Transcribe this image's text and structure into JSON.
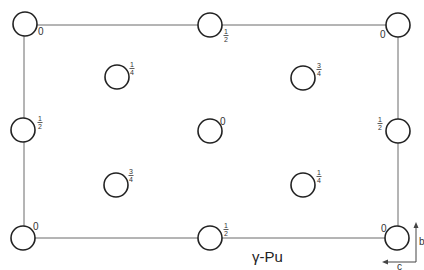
{
  "diagram": {
    "title": "γ-Pu",
    "unit_cell": {
      "x_min": 24,
      "x_max": 398,
      "y_min": 25,
      "y_max": 238
    },
    "atoms": [
      {
        "id": "top-left",
        "cx": 25,
        "cy": 24,
        "label": "0",
        "label_type": "int",
        "lx": 38,
        "ly": 35
      },
      {
        "id": "top-middle",
        "cx": 210,
        "cy": 25,
        "label": "1/2",
        "label_type": "frac",
        "num": "1",
        "den": "2",
        "lx": 226,
        "ly": 35
      },
      {
        "id": "top-right",
        "cx": 398,
        "cy": 25,
        "label": "0",
        "label_type": "int",
        "lx": 380,
        "ly": 38
      },
      {
        "id": "upper-left-inner",
        "cx": 117,
        "cy": 77,
        "label": "1/4",
        "label_type": "frac",
        "num": "1",
        "den": "4",
        "lx": 132,
        "ly": 68
      },
      {
        "id": "upper-right-inner",
        "cx": 303,
        "cy": 78,
        "label": "3/4",
        "label_type": "frac",
        "num": "3",
        "den": "4",
        "lx": 319,
        "ly": 69
      },
      {
        "id": "middle-left",
        "cx": 23,
        "cy": 130,
        "label": "1/2",
        "label_type": "frac",
        "num": "1",
        "den": "2",
        "lx": 40,
        "ly": 122
      },
      {
        "id": "center",
        "cx": 210,
        "cy": 131,
        "label": "0",
        "label_type": "int",
        "lx": 220,
        "ly": 125
      },
      {
        "id": "middle-right",
        "cx": 398,
        "cy": 131,
        "label": "1/2",
        "label_type": "frac",
        "num": "1",
        "den": "2",
        "lx": 380,
        "ly": 123
      },
      {
        "id": "lower-left-inner",
        "cx": 116,
        "cy": 185,
        "label": "3/4",
        "label_type": "frac",
        "num": "3",
        "den": "4",
        "lx": 131,
        "ly": 175
      },
      {
        "id": "lower-right-inner",
        "cx": 303,
        "cy": 185,
        "label": "1/4",
        "label_type": "frac",
        "num": "1",
        "den": "4",
        "lx": 319,
        "ly": 176
      },
      {
        "id": "bottom-left",
        "cx": 23,
        "cy": 238,
        "label": "0",
        "label_type": "int",
        "lx": 33,
        "ly": 230
      },
      {
        "id": "bottom-middle",
        "cx": 210,
        "cy": 238,
        "label": "1/2",
        "label_type": "frac",
        "num": "1",
        "den": "2",
        "lx": 226,
        "ly": 229
      },
      {
        "id": "bottom-right",
        "cx": 397,
        "cy": 238,
        "label": "0",
        "label_type": "int",
        "lx": 381,
        "ly": 232
      }
    ],
    "atom_radius": 12,
    "axes": {
      "b_label": "b",
      "c_label": "c",
      "origin_x": 416,
      "origin_y": 262,
      "b_end_y": 222,
      "c_end_x": 382
    }
  }
}
